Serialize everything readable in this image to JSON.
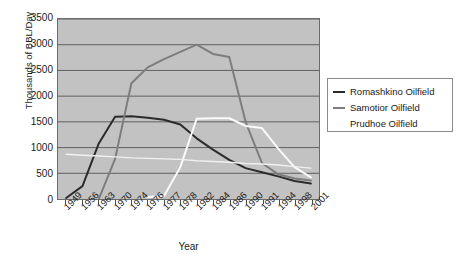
{
  "chart_data": {
    "type": "line",
    "title": "",
    "xlabel": "Year",
    "ylabel": "Thousands of BBL/Day",
    "categories": [
      "1949",
      "1956",
      "1963",
      "1970",
      "1974",
      "1976",
      "1977",
      "1978",
      "1982",
      "1984",
      "1986",
      "1990",
      "1991",
      "1994",
      "1998",
      "2001"
    ],
    "ylim": [
      0,
      3500
    ],
    "yticks": [
      "0",
      "500",
      "1000",
      "1500",
      "2000",
      "2500",
      "3000",
      "3500"
    ],
    "grid": true,
    "legend_position": "right",
    "series": [
      {
        "name": "Romashkino Oilfield",
        "color": "#2b2b2b",
        "values": [
          20,
          250,
          1080,
          1600,
          1610,
          1580,
          1540,
          1450,
          1180,
          960,
          760,
          600,
          520,
          440,
          350,
          300
        ]
      },
      {
        "name": "Samotior Oilfield",
        "color": "#7d7d7d",
        "values": [
          null,
          null,
          0,
          780,
          2250,
          2560,
          2720,
          2860,
          3000,
          2820,
          2760,
          1500,
          700,
          480,
          400,
          360
        ]
      },
      {
        "name": "Prudhoe Oilfield",
        "color": "#fbfbfb",
        "values": [
          null,
          null,
          null,
          null,
          null,
          40,
          60,
          620,
          1560,
          1570,
          1570,
          1420,
          1380,
          980,
          620,
          420
        ]
      },
      {
        "name": "",
        "color": "#f0f0f0",
        "values": [
          870,
          850,
          835,
          820,
          800,
          790,
          780,
          770,
          745,
          730,
          715,
          690,
          680,
          660,
          630,
          600
        ]
      }
    ]
  },
  "legend": {
    "items": [
      {
        "label": "Romashkino Oilfield",
        "color": "#2b2b2b"
      },
      {
        "label": "Samotior Oilfield",
        "color": "#7d7d7d"
      },
      {
        "label": "Prudhoe Oilfield",
        "color": "#fdfdfd"
      }
    ]
  }
}
